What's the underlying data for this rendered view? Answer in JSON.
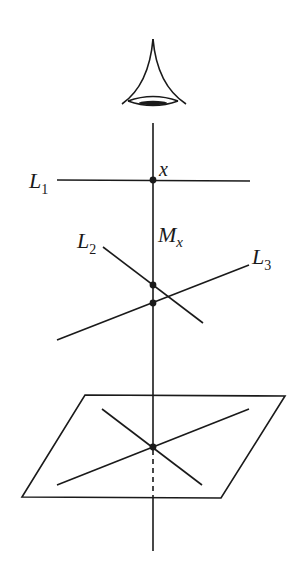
{
  "diagram": {
    "type": "geometric-projection",
    "colors": {
      "stroke": "#1a1a1a",
      "background": "#ffffff"
    },
    "labels": {
      "L1": {
        "base": "L",
        "sub": "1"
      },
      "L2": {
        "base": "L",
        "sub": "2"
      },
      "L3": {
        "base": "L",
        "sub": "3"
      },
      "x": "x",
      "Mx": {
        "base": "M",
        "sub": "x"
      }
    },
    "elements": {
      "eye": "eye-icon",
      "vertical_axis": "line through eye and point x",
      "line_L1": "horizontal line through x",
      "line_L2": "descending line",
      "line_L3": "ascending line",
      "plane": "parallelogram with two crossing lines",
      "points": [
        "x",
        "L2 intersection",
        "L3 intersection",
        "plane intersection"
      ]
    }
  }
}
